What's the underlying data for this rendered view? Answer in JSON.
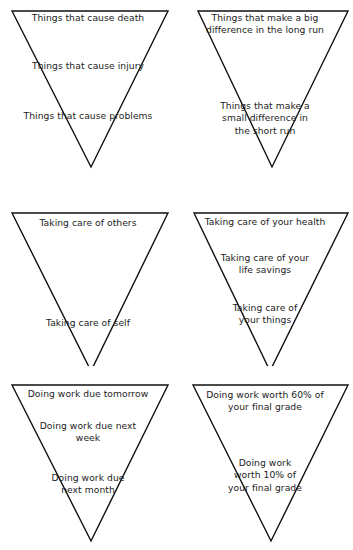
{
  "page": {
    "background_color": "#ffffff",
    "line_color": "#111111",
    "text_color": "#1c1c1c"
  },
  "triangles": [
    {
      "id": "consequences",
      "position": "top-left",
      "lines": [
        {
          "text": "Things that cause death",
          "tier": "tier-a"
        },
        {
          "text": "Things that cause injury",
          "tier": "tier-b"
        },
        {
          "text": "Things that cause problems",
          "tier": "tier-c"
        }
      ]
    },
    {
      "id": "impact-horizon",
      "position": "top-right",
      "lines": [
        {
          "text": "Things that make a big\ndifference in the long run",
          "tier": "tier-a2"
        },
        {
          "text": "Things that make a\nsmall difference in\nthe short run",
          "tier": "tier-b2"
        }
      ]
    },
    {
      "id": "care",
      "position": "middle-left",
      "lines": [
        {
          "text": "Taking care of others",
          "tier": "tier-s1"
        },
        {
          "text": "Taking care of self",
          "tier": "tier-s2"
        }
      ]
    },
    {
      "id": "care-of-assets",
      "position": "middle-right",
      "lines": [
        {
          "text": "Taking care of your health",
          "tier": "tier-top"
        },
        {
          "text": "Taking care of your\nlife savings",
          "tier": "tier-mid"
        },
        {
          "text": "Taking care of\nyour things",
          "tier": "tier-low"
        }
      ]
    },
    {
      "id": "work-deadlines",
      "position": "bottom-left",
      "lines": [
        {
          "text": "Doing work due tomorrow",
          "tier": "tier-w1"
        },
        {
          "text": "Doing work due next\nweek",
          "tier": "tier-w2"
        },
        {
          "text": "Doing work due\nnext month",
          "tier": "tier-w3"
        }
      ]
    },
    {
      "id": "work-weighting",
      "position": "bottom-right",
      "lines": [
        {
          "text": "Doing work worth 60% of\nyour final grade",
          "tier": "tier-g1"
        },
        {
          "text": "Doing work\nworth 10% of\nyour final grade",
          "tier": "tier-g2"
        }
      ]
    }
  ]
}
